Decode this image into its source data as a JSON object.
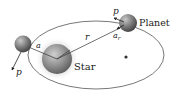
{
  "diagram": {
    "type": "orbital-diagram",
    "labels": {
      "planet": "Planet",
      "star": "Star",
      "radius": "r",
      "momentum_top": "p",
      "momentum_bottom": "p",
      "accel_top": "a",
      "accel_top_sub": "r",
      "accel_left": "a"
    },
    "colors": {
      "orbit": "#555555",
      "body": "#6b6b6b",
      "body_highlight": "#bdbdbd",
      "star_glow": "#d9d9d9",
      "text": "#222222"
    }
  }
}
